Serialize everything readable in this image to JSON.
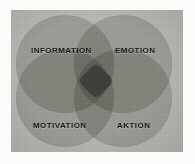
{
  "figure": {
    "kind": "four-set-venn-diagram",
    "canvas_background": "#b6b5b2",
    "page_background": "#fbfbfa",
    "circle_fill": "#d8d7d3",
    "pair_overlap_fill": "#a8a8a5",
    "center_overlap_fill": "#3a3a38",
    "label_color": "#16161a"
  },
  "circles": [
    {
      "id": "information",
      "label": "Information",
      "position": "top-left"
    },
    {
      "id": "emotion",
      "label": "Emotion",
      "position": "top-right"
    },
    {
      "id": "motivation",
      "label": "Motivation",
      "position": "bottom-left"
    },
    {
      "id": "aktion",
      "label": "Aktion",
      "position": "bottom-right"
    }
  ],
  "center": {
    "label": "",
    "description": "intersection of all four sets"
  }
}
